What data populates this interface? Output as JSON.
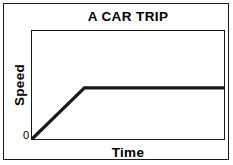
{
  "chart_data": {
    "type": "line",
    "title": "A CAR TRIP",
    "xlabel": "Time",
    "ylabel": "Speed",
    "origin_label": "0",
    "series": [
      {
        "name": "Speed of car",
        "x": [
          0,
          0.273,
          1.0
        ],
        "y": [
          0,
          0.473,
          0.473
        ]
      }
    ],
    "xlim": [
      0,
      1
    ],
    "ylim": [
      0,
      1
    ],
    "grid": false,
    "legend": false,
    "xticks": [],
    "yticks": [],
    "annotations": [],
    "line_color": "#1a1a1a",
    "frame_color": "#1a1a1a",
    "background_color": "#ffffff"
  }
}
